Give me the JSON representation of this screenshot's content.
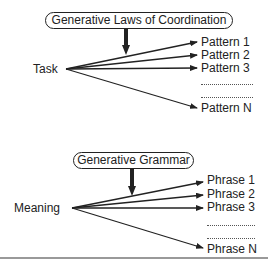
{
  "top_diagram": {
    "generator_label": "Generative Laws of Coordination",
    "source_label": "Task",
    "outputs": [
      "Pattern 1",
      "Pattern 2",
      "Pattern 3",
      "Pattern N"
    ],
    "ellipsis": "...................."
  },
  "bottom_diagram": {
    "generator_label": "Generative Grammar",
    "source_label": "Meaning",
    "outputs": [
      "Phrase 1",
      "Phrase 2",
      "Phrase 3",
      "Phrase N"
    ],
    "ellipsis": "...................."
  }
}
